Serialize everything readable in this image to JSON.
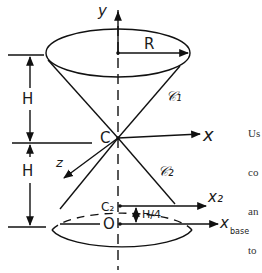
{
  "diagram": {
    "labels": {
      "y_axis": "y",
      "x_axis": "x",
      "z_axis": "z",
      "radius": "R",
      "cone_top": "𝒞₁",
      "cone_bottom": "𝒞₂",
      "apex": "C",
      "height_upper": "H",
      "height_lower": "H",
      "c2_point": "C₂",
      "x2_axis": "x₂",
      "origin": "O",
      "xbase_axis": "x",
      "xbase_sub": "base",
      "quarter_height": "H/4"
    }
  },
  "side_text": {
    "lines": [
      "Us",
      "co",
      "an",
      "to"
    ]
  }
}
